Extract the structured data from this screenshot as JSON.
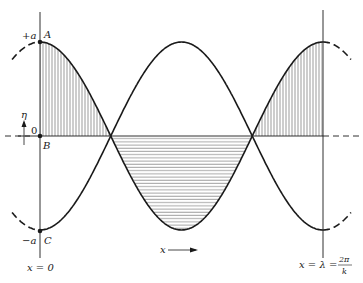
{
  "diagram": {
    "title": "",
    "labels": {
      "plus_a": "+a",
      "minus_a": "−a",
      "point_A": "A",
      "point_B": "B",
      "point_C": "C",
      "origin": "0",
      "eta": "η",
      "x_axis_arrow": "x",
      "left_line": "x = 0",
      "right_line_prefix": "x = λ =",
      "right_line_num": "2π",
      "right_line_den": "k"
    },
    "geometry": {
      "left_x": 40,
      "right_x": 323,
      "baseline_y": 136,
      "amplitude_px": 94,
      "crossings_x": [
        111,
        252
      ]
    },
    "colors": {
      "stroke": "#1a1a1a",
      "hatch": "#555555",
      "background": "#ffffff"
    },
    "curves": [
      {
        "name": "cosine-curve",
        "description": "η = +a cos(kx), starts at A (+a) at x=0, ends at +a at x=λ"
      },
      {
        "name": "negative-cosine-curve",
        "description": "η = −a cos(kx), starts at C (−a) at x=0, ends at −a at x=λ"
      }
    ],
    "shaded_regions": [
      {
        "name": "left-lobe",
        "hatch": "vertical",
        "between": "x=0 and first crossing, above baseline"
      },
      {
        "name": "middle-lobe",
        "hatch": "horizontal",
        "between": "crossings, below baseline"
      },
      {
        "name": "right-lobe",
        "hatch": "vertical",
        "between": "second crossing and x=λ, above baseline"
      }
    ]
  }
}
